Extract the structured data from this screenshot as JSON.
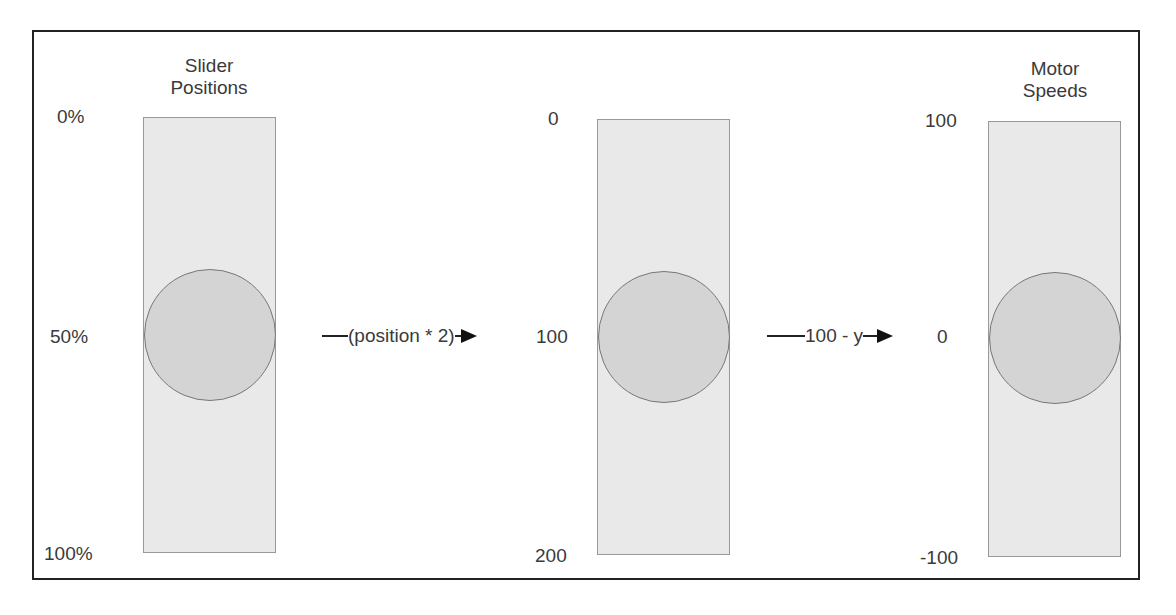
{
  "sliders": [
    {
      "title_line1": "Slider",
      "title_line2": "Positions",
      "top_label": "0%",
      "mid_label": "50%",
      "bottom_label": "100%"
    },
    {
      "title_line1": "",
      "title_line2": "",
      "top_label": "0",
      "mid_label": "100",
      "bottom_label": "200"
    },
    {
      "title_line1": "Motor",
      "title_line2": "Speeds",
      "top_label": "100",
      "mid_label": "0",
      "bottom_label": "-100"
    }
  ],
  "connectors": [
    {
      "label": "(position * 2)"
    },
    {
      "label": "100 - y"
    }
  ]
}
